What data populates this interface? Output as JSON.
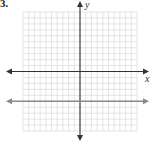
{
  "problem_number": "3.",
  "chart_data": {
    "type": "line",
    "title": "",
    "xlabel": "x",
    "ylabel": "y",
    "xlim": [
      -10,
      10
    ],
    "ylim": [
      -10,
      10
    ],
    "grid": true,
    "series": [
      {
        "name": "horizontal line y = -5",
        "equation": "y = -5",
        "points": [
          [
            -10,
            -5
          ],
          [
            10,
            -5
          ]
        ],
        "color": "#8a8a8a"
      }
    ]
  },
  "colors": {
    "grid": "#d4d4d4",
    "axis": "#333333",
    "line": "#8a8a8a"
  }
}
